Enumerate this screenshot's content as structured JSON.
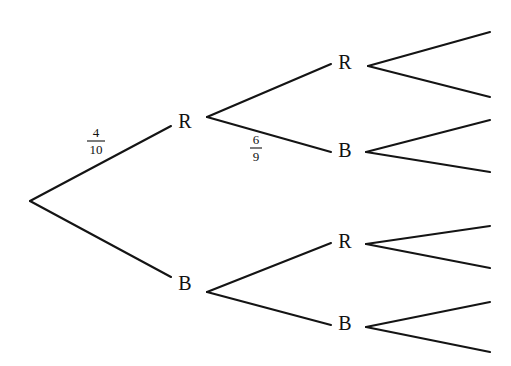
{
  "diagram": {
    "kind": "probability-tree",
    "background_color": "#ffffff",
    "line_color": "#141414",
    "text_color": "#111111",
    "width": 511,
    "height": 366,
    "root": {
      "x": 30,
      "y": 201
    },
    "levels": [
      {
        "index": 1,
        "nodes": [
          {
            "id": "n-r1",
            "label": "R",
            "x": 185,
            "y": 123,
            "branch_x": 207,
            "branch_y": 117
          },
          {
            "id": "n-b1",
            "label": "B",
            "x": 185,
            "y": 285,
            "branch_x": 207,
            "branch_y": 292
          }
        ]
      },
      {
        "index": 2,
        "nodes": [
          {
            "id": "n-r2a",
            "label": "R",
            "x": 345,
            "y": 64,
            "branch_x": 368,
            "branch_y": 66
          },
          {
            "id": "n-b2a",
            "label": "B",
            "x": 345,
            "y": 152,
            "branch_x": 366,
            "branch_y": 152
          },
          {
            "id": "n-r2b",
            "label": "R",
            "x": 345,
            "y": 243,
            "branch_x": 366,
            "branch_y": 244
          },
          {
            "id": "n-b2b",
            "label": "B",
            "x": 345,
            "y": 325,
            "branch_x": 366,
            "branch_y": 327
          }
        ]
      }
    ],
    "branches": [
      {
        "id": "br-root-r",
        "from_x": 30,
        "from_y": 201,
        "to_x": 171,
        "to_y": 126
      },
      {
        "id": "br-root-b",
        "from_x": 30,
        "from_y": 201,
        "to_x": 171,
        "to_y": 277
      },
      {
        "id": "br-r1-r2a",
        "from_x": 207,
        "from_y": 117,
        "to_x": 331,
        "to_y": 64
      },
      {
        "id": "br-r1-b2a",
        "from_x": 207,
        "from_y": 117,
        "to_x": 331,
        "to_y": 152
      },
      {
        "id": "br-b1-r2b",
        "from_x": 207,
        "from_y": 292,
        "to_x": 331,
        "to_y": 243
      },
      {
        "id": "br-b1-b2b",
        "from_x": 207,
        "from_y": 292,
        "to_x": 331,
        "to_y": 325
      },
      {
        "id": "br-r2a-out1",
        "from_x": 368,
        "from_y": 66,
        "to_x": 490,
        "to_y": 32
      },
      {
        "id": "br-r2a-out2",
        "from_x": 368,
        "from_y": 66,
        "to_x": 490,
        "to_y": 97
      },
      {
        "id": "br-b2a-out1",
        "from_x": 366,
        "from_y": 152,
        "to_x": 490,
        "to_y": 120
      },
      {
        "id": "br-b2a-out2",
        "from_x": 366,
        "from_y": 152,
        "to_x": 490,
        "to_y": 172
      },
      {
        "id": "br-r2b-out1",
        "from_x": 366,
        "from_y": 244,
        "to_x": 490,
        "to_y": 226
      },
      {
        "id": "br-r2b-out2",
        "from_x": 366,
        "from_y": 244,
        "to_x": 490,
        "to_y": 268
      },
      {
        "id": "br-b2b-out1",
        "from_x": 366,
        "from_y": 327,
        "to_x": 490,
        "to_y": 302
      },
      {
        "id": "br-b2b-out2",
        "from_x": 366,
        "from_y": 327,
        "to_x": 490,
        "to_y": 352
      }
    ],
    "fraction_labels": [
      {
        "id": "frac-4-10",
        "numerator": "4",
        "denominator": "10",
        "x": 96,
        "y": 140,
        "on_branch": "br-root-r"
      },
      {
        "id": "frac-6-9",
        "numerator": "6",
        "denominator": "9",
        "x": 256,
        "y": 147,
        "on_branch": "br-r1-b2a"
      }
    ]
  }
}
